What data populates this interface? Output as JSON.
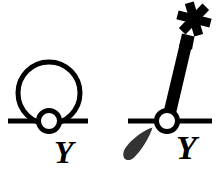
{
  "figure": {
    "background_color": "#ffffff",
    "stroke_color": "#000000",
    "drip_color": "#333333",
    "width": 221,
    "height": 177,
    "panels": [
      {
        "id": "left-panel",
        "name": "self-energy-loop-diagram",
        "label": "Y",
        "label_text": "Y",
        "elements": [
          {
            "name": "propagator-line",
            "type": "horizontal-line",
            "x1": 8,
            "y1": 121,
            "x2": 88,
            "y2": 121,
            "stroke_width": 5
          },
          {
            "name": "loop-circle",
            "type": "circle",
            "cx": 49,
            "cy": 93,
            "r": 31,
            "stroke_width": 5,
            "fill": "none"
          },
          {
            "name": "vertex-circle",
            "type": "circle",
            "cx": 49,
            "cy": 121,
            "r": 10,
            "stroke_width": 5,
            "fill": "#ffffff"
          }
        ]
      },
      {
        "id": "right-panel",
        "name": "lit-match-diagram",
        "label": "Y",
        "label_text": "Y",
        "elements": [
          {
            "name": "propagator-line",
            "type": "horizontal-line",
            "x1": 128,
            "y1": 121,
            "x2": 212,
            "y2": 121,
            "stroke_width": 5
          },
          {
            "name": "vertex-circle",
            "type": "circle",
            "cx": 167,
            "cy": 121,
            "r": 10,
            "stroke_width": 5,
            "fill": "#ffffff"
          },
          {
            "name": "match-stick",
            "type": "tapered-bar",
            "angle_degrees": 20,
            "length": 95,
            "fill": "#000000"
          },
          {
            "name": "spark-burst-icon",
            "type": "asterisk-star",
            "cx": 194,
            "cy": 19,
            "arms": 6,
            "fill": "#000000"
          },
          {
            "name": "drip-teardrop",
            "type": "teardrop",
            "cx": 138,
            "cy": 148,
            "fill": "#333333"
          }
        ]
      }
    ]
  }
}
